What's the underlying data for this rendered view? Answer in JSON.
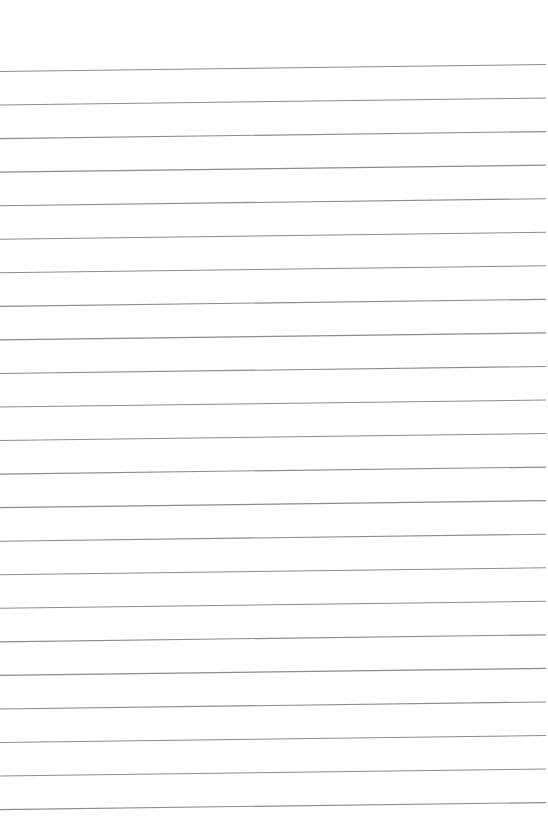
{
  "page": {
    "type": "ruled-paper",
    "background": "#ffffff",
    "line_color": "#8c8c8c",
    "line_count": 23,
    "line_left_x": 0,
    "line_right_x": 546,
    "first_line_left_y": 71.5,
    "first_line_right_y": 64.5,
    "line_spacing": 33.55,
    "line_width": 1.1
  }
}
